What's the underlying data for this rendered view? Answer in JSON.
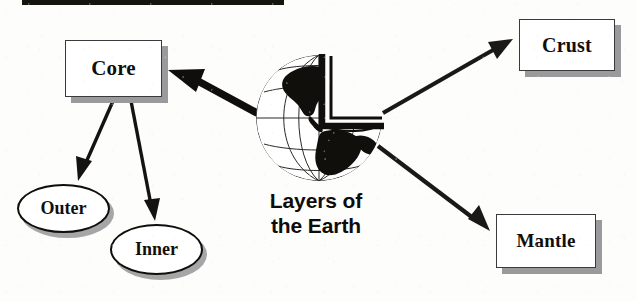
{
  "diagram": {
    "title_line1": "Layers of",
    "title_line2": "the Earth",
    "background_color": "#fdfdfc",
    "ink_color": "#100f0c",
    "shadow_color": "#9a9a9c"
  },
  "top_bar": {
    "name": "top-black-bar",
    "color": "#15140f"
  },
  "boxes": [
    {
      "id": "core",
      "label": "Core",
      "shape": "rectangle"
    },
    {
      "id": "crust",
      "label": "Crust",
      "shape": "rectangle"
    },
    {
      "id": "mantle",
      "label": "Mantle",
      "shape": "rectangle"
    }
  ],
  "ellipses": [
    {
      "id": "outer",
      "label": "Outer",
      "shape": "ellipse"
    },
    {
      "id": "inner",
      "label": "Inner",
      "shape": "ellipse"
    }
  ],
  "arrows": [
    {
      "id": "globe-to-core",
      "from": "globe",
      "to": "core",
      "style": "thick"
    },
    {
      "id": "globe-to-crust",
      "from": "globe",
      "to": "crust",
      "style": "thin"
    },
    {
      "id": "globe-to-mantle",
      "from": "globe",
      "to": "mantle",
      "style": "thin"
    },
    {
      "id": "core-to-outer",
      "from": "core",
      "to": "outer",
      "style": "thin"
    },
    {
      "id": "core-to-inner",
      "from": "core",
      "to": "inner",
      "style": "thin"
    }
  ],
  "globe": {
    "name": "cutaway-earth-globe",
    "description": "Sphere with latitude and longitude grid, black continents, wedge cut from upper right"
  }
}
